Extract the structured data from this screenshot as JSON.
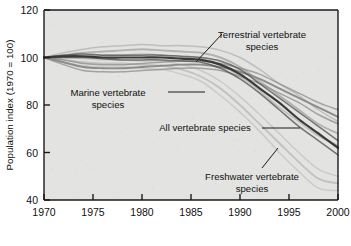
{
  "chart_data": {
    "type": "line",
    "title": "",
    "xlabel": "",
    "ylabel": "Population index (1970 = 100)",
    "xlim": [
      1970,
      2000
    ],
    "ylim": [
      40,
      120
    ],
    "grid": false,
    "legend_position": "inline-annotations",
    "xticks": [
      "1970",
      "1975",
      "1980",
      "1985",
      "1990",
      "1995",
      "2000"
    ],
    "yticks": [
      "40",
      "60",
      "80",
      "100",
      "120"
    ],
    "x": [
      1970,
      1972,
      1974,
      1976,
      1978,
      1980,
      1982,
      1984,
      1986,
      1988,
      1990,
      1992,
      1994,
      1996,
      1998,
      2000
    ],
    "series": [
      {
        "name": "Terrestrial vertebrate species",
        "values": [
          100,
          101,
          102,
          102.5,
          103,
          103.5,
          103,
          102.5,
          102,
          100,
          96,
          90,
          84,
          78,
          72,
          68
        ],
        "upper": [
          100,
          102,
          103.5,
          104.5,
          105,
          105.5,
          105,
          105,
          104.5,
          103,
          100,
          95,
          89,
          84,
          78,
          73
        ],
        "lower": [
          100,
          100,
          100.5,
          101,
          101,
          101.5,
          101,
          100,
          99.5,
          97,
          92,
          86,
          79,
          73,
          67,
          63
        ]
      },
      {
        "name": "All vertebrate species",
        "values": [
          100,
          100.5,
          100.5,
          100,
          100,
          100,
          100,
          99.5,
          99,
          97,
          93,
          87,
          81,
          74,
          68,
          62
        ],
        "upper": [
          100,
          101,
          101.5,
          101,
          101,
          101,
          101,
          100.5,
          100,
          98.5,
          95,
          89,
          83,
          77,
          71,
          65
        ],
        "lower": [
          100,
          100,
          100,
          99.5,
          99,
          99,
          99,
          98.5,
          98,
          95.5,
          91,
          85,
          78,
          71,
          65,
          59
        ]
      },
      {
        "name": "Marine vertebrate species",
        "values": [
          100,
          98,
          96,
          95.5,
          95.5,
          96,
          96.5,
          97,
          97,
          96,
          94,
          91,
          87,
          83,
          79,
          75
        ],
        "upper": [
          100,
          99,
          97.5,
          97,
          97,
          97.5,
          98,
          98.5,
          98.5,
          97.5,
          95.5,
          93,
          89,
          85,
          81,
          78
        ],
        "lower": [
          100,
          97,
          94.5,
          94,
          94,
          94.5,
          95,
          95.5,
          95.5,
          94.5,
          92,
          89,
          85,
          81,
          76,
          72
        ]
      },
      {
        "name": "Freshwater vertebrate species",
        "values": [
          100,
          99,
          98,
          97.5,
          97.5,
          97,
          96.5,
          95,
          92,
          87,
          80,
          72,
          64,
          56,
          49,
          47
        ],
        "upper": [
          100,
          100,
          99.5,
          99,
          99,
          98.5,
          98.5,
          97,
          94.5,
          90,
          83.5,
          76,
          68,
          60,
          53,
          50
        ],
        "lower": [
          100,
          98,
          96.5,
          96,
          96,
          95.5,
          95,
          93,
          90,
          84,
          77,
          69,
          60,
          52,
          45,
          44
        ]
      }
    ],
    "annotations": [
      {
        "id": "terrestrial",
        "line1": "Terrestrial vertebrate",
        "line2": "species"
      },
      {
        "id": "marine",
        "line1": "Marine vertebrate",
        "line2": "species"
      },
      {
        "id": "all",
        "line1": "All vertebrate species",
        "line2": ""
      },
      {
        "id": "freshwater",
        "line1": "Freshwater vertebrate",
        "line2": "species"
      }
    ],
    "colors": {
      "plot_background": "#e3e3e1",
      "axis": "#1a1a1a",
      "terrestrial": "#b2b2b0",
      "all": "#4d4d4d",
      "marine": "#8c8c8a",
      "freshwater": "#c2c2c0"
    }
  }
}
